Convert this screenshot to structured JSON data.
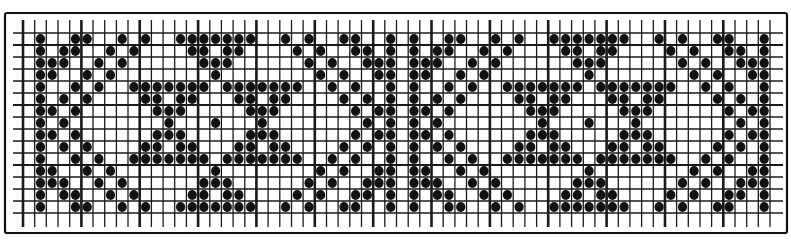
{
  "chart": {
    "title": "",
    "type": "knitting-pattern-grid",
    "columns": 64,
    "rows": 15,
    "major_every_columns": 5,
    "major_rows": [
      1,
      6,
      11
    ],
    "colors": {
      "ink": "#111111",
      "background": "#ffffff"
    },
    "filled_cells_by_row": [
      [
        1,
        4,
        5,
        8,
        10,
        13,
        14,
        15,
        16,
        17,
        18,
        19,
        22,
        24,
        27,
        28,
        31,
        33,
        36,
        37,
        40,
        42,
        45,
        46,
        47,
        48,
        49,
        50,
        51,
        54,
        56,
        59,
        60,
        63
      ],
      [
        1,
        3,
        4,
        7,
        9,
        14,
        15,
        17,
        18,
        23,
        25,
        28,
        29,
        31,
        33,
        35,
        36,
        39,
        41,
        46,
        47,
        49,
        50,
        55,
        57,
        60,
        61,
        63
      ],
      [
        1,
        2,
        3,
        6,
        8,
        15,
        16,
        17,
        24,
        26,
        29,
        30,
        31,
        33,
        34,
        35,
        38,
        40,
        47,
        48,
        49,
        56,
        58,
        61,
        62,
        63
      ],
      [
        1,
        2,
        5,
        7,
        16,
        25,
        27,
        30,
        31,
        33,
        34,
        37,
        39,
        48,
        57,
        59,
        62,
        63
      ],
      [
        1,
        4,
        6,
        9,
        10,
        11,
        12,
        13,
        14,
        15,
        17,
        18,
        19,
        20,
        21,
        22,
        23,
        26,
        28,
        31,
        33,
        36,
        38,
        41,
        42,
        43,
        44,
        45,
        46,
        47,
        49,
        50,
        51,
        52,
        53,
        54,
        55,
        58,
        60,
        63
      ],
      [
        1,
        3,
        5,
        10,
        11,
        13,
        14,
        18,
        19,
        21,
        22,
        27,
        29,
        31,
        33,
        35,
        37,
        42,
        43,
        45,
        46,
        50,
        51,
        53,
        54,
        59,
        61,
        63
      ],
      [
        1,
        2,
        4,
        11,
        12,
        13,
        19,
        20,
        21,
        28,
        30,
        31,
        33,
        34,
        36,
        43,
        44,
        45,
        51,
        52,
        53,
        60,
        62,
        63
      ],
      [
        1,
        3,
        12,
        16,
        20,
        29,
        31,
        33,
        35,
        44,
        48,
        52,
        61,
        63
      ],
      [
        1,
        2,
        4,
        11,
        12,
        13,
        19,
        20,
        21,
        28,
        30,
        31,
        33,
        34,
        36,
        43,
        44,
        45,
        51,
        52,
        53,
        60,
        62,
        63
      ],
      [
        1,
        3,
        5,
        10,
        11,
        13,
        14,
        18,
        19,
        21,
        22,
        27,
        29,
        31,
        33,
        35,
        37,
        42,
        43,
        45,
        46,
        50,
        51,
        53,
        54,
        59,
        61,
        63
      ],
      [
        1,
        4,
        6,
        9,
        10,
        11,
        12,
        13,
        14,
        15,
        17,
        18,
        19,
        20,
        21,
        22,
        23,
        26,
        28,
        31,
        33,
        36,
        38,
        41,
        42,
        43,
        44,
        45,
        46,
        47,
        49,
        50,
        51,
        52,
        53,
        54,
        55,
        58,
        60,
        63
      ],
      [
        1,
        2,
        5,
        7,
        16,
        25,
        27,
        30,
        31,
        33,
        34,
        37,
        39,
        48,
        57,
        59,
        62,
        63
      ],
      [
        1,
        2,
        3,
        6,
        8,
        15,
        16,
        17,
        24,
        26,
        29,
        30,
        31,
        33,
        34,
        35,
        38,
        40,
        47,
        48,
        49,
        56,
        58,
        61,
        62,
        63
      ],
      [
        1,
        3,
        4,
        7,
        9,
        14,
        15,
        17,
        18,
        23,
        25,
        28,
        29,
        31,
        33,
        35,
        36,
        39,
        41,
        46,
        47,
        49,
        50,
        55,
        57,
        60,
        61,
        63
      ],
      [
        1,
        4,
        5,
        8,
        10,
        13,
        14,
        15,
        16,
        17,
        18,
        19,
        22,
        24,
        27,
        28,
        31,
        33,
        36,
        37,
        40,
        42,
        45,
        46,
        47,
        48,
        49,
        50,
        51,
        54,
        56,
        59,
        60,
        63
      ]
    ]
  },
  "chart_data": {
    "type": "heatmap",
    "title": "",
    "xlabel": "",
    "ylabel": "",
    "grid": true,
    "legend": null,
    "dimensions": {
      "columns": 64,
      "rows": 15
    },
    "cell_values": "1 = filled dot, 0 = empty; see chart.filled_cells_by_row for 0-indexed filled column positions per row (row 0 = top)"
  }
}
